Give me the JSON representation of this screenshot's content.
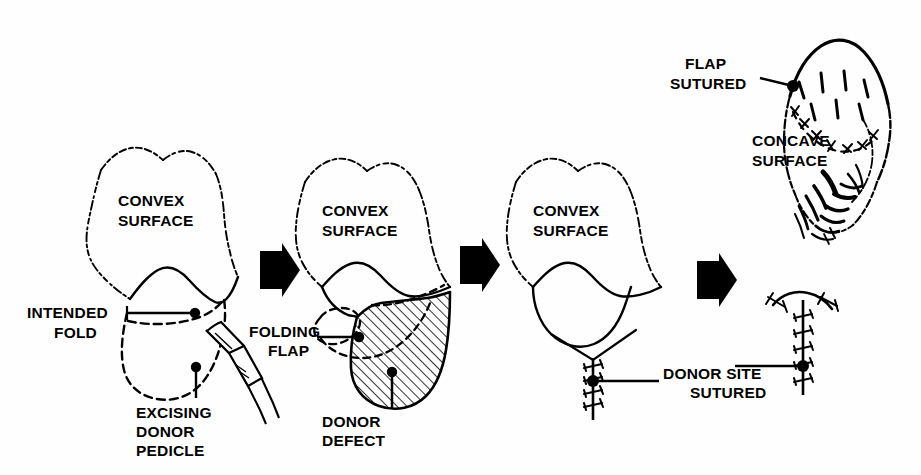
{
  "figure": {
    "type": "medical-line-illustration",
    "panel_count": 4,
    "ink_color": "#000000",
    "background_color": "#ffffff"
  },
  "panels": [
    {
      "id": "panel-1",
      "order": 1,
      "caption": "Donor pedicle marked and excised on the convex surface",
      "labels": [
        {
          "id": "convex-surface-1",
          "lines": [
            "CONVEX",
            "SURFACE"
          ],
          "x": 118,
          "y": 200
        },
        {
          "id": "intended-fold",
          "lines": [
            "INTENDED",
            "FOLD"
          ],
          "x": 30,
          "y": 310
        },
        {
          "id": "excising-donor-pedicle",
          "lines": [
            "EXCISING",
            "DONOR",
            "PEDICLE"
          ],
          "x": 134,
          "y": 404
        }
      ],
      "features": [
        "convex-surface-outline",
        "intended-fold-line",
        "dashed-flap-outline",
        "scalpel",
        "leader-dots"
      ]
    },
    {
      "id": "panel-2",
      "order": 2,
      "caption": "Flap folded leaving a hatched donor defect",
      "labels": [
        {
          "id": "convex-surface-2",
          "lines": [
            "CONVEX",
            "SURFACE"
          ],
          "x": 322,
          "y": 210
        },
        {
          "id": "folding-flap",
          "lines": [
            "FOLDING",
            "FLAP"
          ],
          "x": 255,
          "y": 332
        },
        {
          "id": "donor-defect",
          "lines": [
            "DONOR",
            "DEFECT"
          ],
          "x": 322,
          "y": 412
        }
      ],
      "features": [
        "convex-surface-outline",
        "folded-flap-dashed",
        "donor-defect-hatched",
        "leader-dots"
      ]
    },
    {
      "id": "panel-3",
      "order": 3,
      "caption": "Donor site closed with a vertical suture line",
      "labels": [
        {
          "id": "convex-surface-3",
          "lines": [
            "CONVEX",
            "SURFACE"
          ],
          "x": 533,
          "y": 210
        },
        {
          "id": "donor-site-sutured",
          "lines": [
            "DONOR SITE",
            "SUTURED"
          ],
          "x": 662,
          "y": 374
        }
      ],
      "features": [
        "convex-surface-outline",
        "closed-defect-outline",
        "vertical-suture-line",
        "leader-dot"
      ]
    },
    {
      "id": "panel-4",
      "order": 4,
      "caption": "Flap sutured in place over the concave surface",
      "labels": [
        {
          "id": "flap-sutured",
          "lines": [
            "FLAP",
            "SUTURED"
          ],
          "x": 682,
          "y": 62
        },
        {
          "id": "concave-surface",
          "lines": [
            "CONCAVE",
            "SURFACE"
          ],
          "x": 752,
          "y": 138
        }
      ],
      "features": [
        "flap-outline",
        "curved-suture-line",
        "radiating-creases",
        "shaded-folds",
        "t-shaped-suture-line",
        "leader-dot"
      ]
    }
  ],
  "arrows": [
    {
      "id": "arrow-1",
      "points": "right",
      "x": 258,
      "y": 248
    },
    {
      "id": "arrow-2",
      "points": "right",
      "x": 458,
      "y": 243
    },
    {
      "id": "arrow-3",
      "points": "right",
      "x": 695,
      "y": 258
    }
  ]
}
